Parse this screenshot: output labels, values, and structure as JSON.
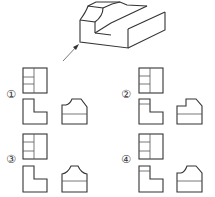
{
  "figure": {
    "type": "orthographic-projection-question",
    "isometric_view": {
      "description": "stepped block with curved notch",
      "arrow": "front-view-direction-arrow"
    },
    "options": [
      {
        "label": "①",
        "top_view": "rect with vertical divider and 2 horizontal lines on left",
        "front_view": "L-shape",
        "side_view": "profile with concave curve on left top, chamfer right"
      },
      {
        "label": "②",
        "top_view": "rect with vertical divider and 2 horizontal lines on left",
        "front_view": "L-shape with extra line",
        "side_view": "profile with straight step left top, chamfer right"
      },
      {
        "label": "③",
        "top_view": "rect with vertical divider and 2 horizontal lines on left",
        "front_view": "L-shape",
        "side_view": "profile with concave curves both sides"
      },
      {
        "label": "④",
        "top_view": "rect with vertical divider and 2 horizontal lines on left",
        "front_view": "L-shape with extra line",
        "side_view": "profile with convex curve left top, chamfer right"
      }
    ]
  },
  "labels": {
    "opt1": "①",
    "opt2": "②",
    "opt3": "③",
    "opt4": "④"
  },
  "colors": {
    "line": "#333333",
    "background": "#ffffff"
  }
}
